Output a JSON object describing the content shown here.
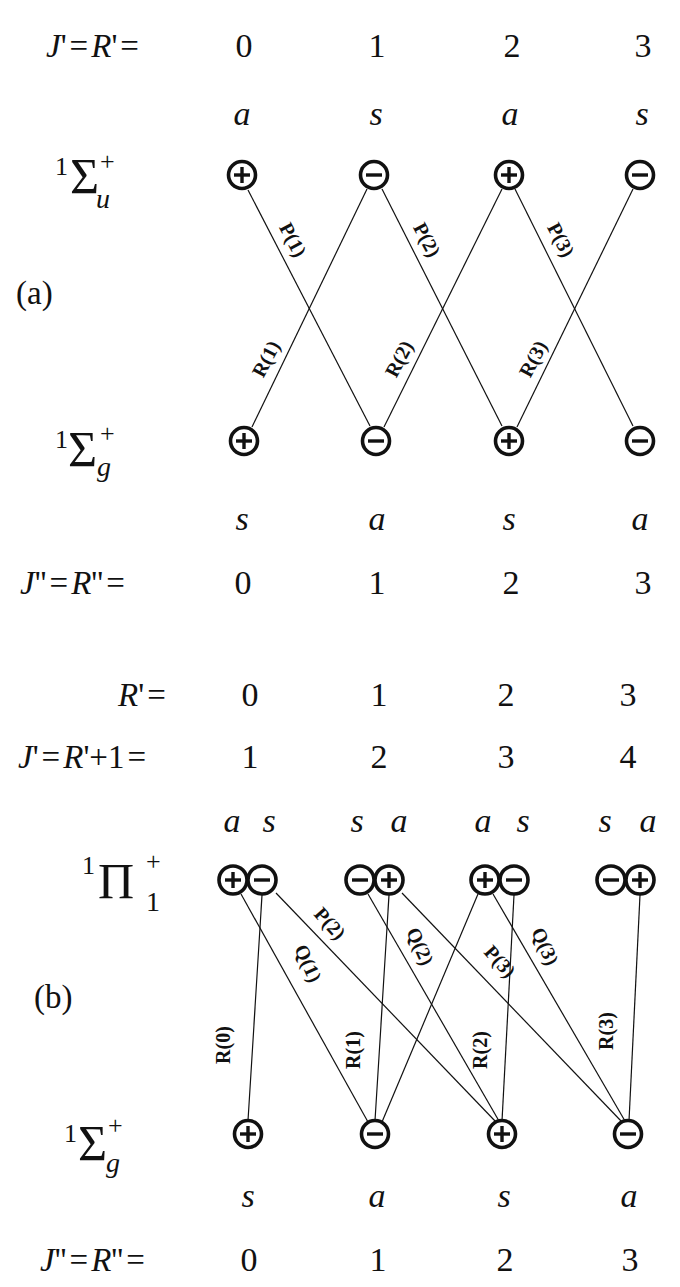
{
  "panel_a": {
    "label": "(a)",
    "upper": {
      "row_label": "J' = R' =",
      "values": [
        "0",
        "1",
        "2",
        "3"
      ],
      "symmetry": [
        "a",
        "s",
        "a",
        "s"
      ],
      "state": {
        "mult": "1",
        "term": "Σ",
        "sup": "+",
        "sub": "u"
      },
      "parity": [
        "+",
        "−",
        "+",
        "−"
      ]
    },
    "lower": {
      "row_label": "J'' = R'' =",
      "values": [
        "0",
        "1",
        "2",
        "3"
      ],
      "symmetry": [
        "s",
        "a",
        "s",
        "a"
      ],
      "state": {
        "mult": "1",
        "term": "Σ",
        "sup": "+",
        "sub": "g"
      },
      "parity": [
        "+",
        "−",
        "+",
        "−"
      ]
    },
    "transitions": [
      {
        "label": "P(1)",
        "upper": 0,
        "lower": 1
      },
      {
        "label": "P(2)",
        "upper": 1,
        "lower": 2
      },
      {
        "label": "P(3)",
        "upper": 2,
        "lower": 3
      },
      {
        "label": "R(1)",
        "upper": 1,
        "lower": 0
      },
      {
        "label": "R(2)",
        "upper": 2,
        "lower": 1
      },
      {
        "label": "R(3)",
        "upper": 3,
        "lower": 2
      }
    ]
  },
  "panel_b": {
    "label": "(b)",
    "upper": {
      "row1_label": "R' =",
      "row1_values": [
        "0",
        "1",
        "2",
        "3"
      ],
      "row2_label": "J' = R'+1 =",
      "row2_values": [
        "1",
        "2",
        "3",
        "4"
      ],
      "symmetry_pairs": [
        [
          "a",
          "s"
        ],
        [
          "s",
          "a"
        ],
        [
          "a",
          "s"
        ],
        [
          "s",
          "a"
        ]
      ],
      "state": {
        "mult": "1",
        "term": "Π",
        "sup": "+",
        "sub": "1"
      },
      "parity_pairs": [
        [
          "+",
          "−"
        ],
        [
          "−",
          "+"
        ],
        [
          "+",
          "−"
        ],
        [
          "−",
          "+"
        ]
      ]
    },
    "lower": {
      "row_label": "J'' = R'' =",
      "values": [
        "0",
        "1",
        "2",
        "3"
      ],
      "symmetry": [
        "s",
        "a",
        "s",
        "a"
      ],
      "state": {
        "mult": "1",
        "term": "Σ",
        "sup": "+",
        "sub": "g"
      },
      "parity": [
        "+",
        "−",
        "+",
        "−"
      ]
    },
    "transitions": [
      {
        "label": "R(0)",
        "upper": "0-",
        "lower": 0
      },
      {
        "label": "Q(1)",
        "upper": "0+",
        "lower": 1
      },
      {
        "label": "P(2)",
        "upper": "0-",
        "lower": 2
      },
      {
        "label": "R(1)",
        "upper": "1+",
        "lower": 1
      },
      {
        "label": "Q(2)",
        "upper": "1-",
        "lower": 2
      },
      {
        "label": "P(3)",
        "upper": "1+",
        "lower": 3
      },
      {
        "label": "",
        "upper": "2+",
        "lower": 1
      },
      {
        "label": "R(2)",
        "upper": "2-",
        "lower": 2
      },
      {
        "label": "Q(3)",
        "upper": "2+",
        "lower": 3
      },
      {
        "label": "R(3)",
        "upper": "3+",
        "lower": 3
      }
    ]
  }
}
